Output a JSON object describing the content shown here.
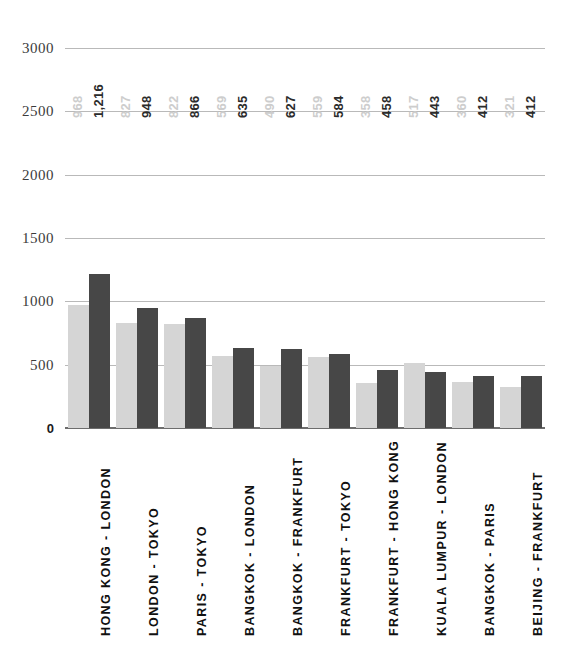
{
  "chart_data": {
    "type": "bar",
    "title": "",
    "subtitle": "",
    "xlabel": "",
    "ylabel": "",
    "grid": true,
    "legend_position": "none",
    "ylim": [
      0,
      3000
    ],
    "yticks": [
      0,
      500,
      1000,
      1500,
      2000,
      2500,
      3000
    ],
    "ytick_labels": [
      "0",
      "500",
      "1000",
      "1500",
      "2000",
      "2500",
      "3000"
    ],
    "categories": [
      "HONG KONG - LONDON",
      "LONDON - TOKYO",
      "PARIS - TOKYO",
      "BANGKOK - LONDON",
      "BANGKOK - FRANKFURT",
      "FRANKFURT - TOKYO",
      "FRANKFURT - HONG KONG",
      "KUALA LUMPUR - LONDON",
      "BANGKOK - PARIS",
      "BEIJING - FRANKFURT"
    ],
    "series": [
      {
        "name": "series-1",
        "color": "#d5d5d5",
        "values": [
          968,
          827,
          822,
          569,
          490,
          559,
          358,
          517,
          360,
          321
        ],
        "labels": [
          "968",
          "827",
          "822",
          "569",
          "490",
          "559",
          "358",
          "517",
          "360",
          "321"
        ]
      },
      {
        "name": "series-2",
        "color": "#474747",
        "values": [
          1216,
          948,
          866,
          635,
          627,
          584,
          458,
          443,
          412,
          412
        ],
        "labels": [
          "1,216",
          "948",
          "866",
          "635",
          "627",
          "584",
          "458",
          "443",
          "412",
          "412"
        ]
      }
    ]
  },
  "colors": {
    "series_1": "#d5d5d5",
    "series_2": "#474747",
    "gridline": "#b9b9b9",
    "baseline": "#6d6d6d",
    "axis_text": "#3b3b3b",
    "category_text": "#111111",
    "background": "#ffffff"
  }
}
